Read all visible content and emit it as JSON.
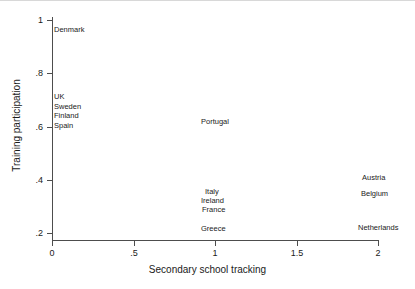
{
  "chart_data": {
    "type": "scatter",
    "title": "",
    "xlabel": "Secondary school tracking",
    "ylabel": "Training participation",
    "xlim": [
      -0.05,
      2.05
    ],
    "ylim": [
      0.17,
      1.03
    ],
    "grid": false,
    "legend": "none",
    "marker_style": "country-name-text-labels",
    "xticks": [
      "0",
      ".5",
      "1",
      "1.5",
      "2"
    ],
    "xtick_values": [
      0,
      0.5,
      1,
      1.5,
      2
    ],
    "yticks": [
      "1",
      ".8",
      ".6",
      ".4",
      ".2"
    ],
    "ytick_values": [
      1,
      0.8,
      0.6,
      0.4,
      0.2
    ],
    "points": [
      {
        "label": "Denmark",
        "x": 0,
        "y": 0.955
      },
      {
        "label": "UK",
        "x": 0,
        "y": 0.705
      },
      {
        "label": "Sweden",
        "x": 0,
        "y": 0.667
      },
      {
        "label": "Finland",
        "x": 0,
        "y": 0.633
      },
      {
        "label": "Spain",
        "x": 0,
        "y": 0.595
      },
      {
        "label": "Portugal",
        "x": 1,
        "y": 0.625
      },
      {
        "label": "Italy",
        "x": 1,
        "y": 0.36
      },
      {
        "label": "Ireland",
        "x": 1,
        "y": 0.325
      },
      {
        "label": "France",
        "x": 1,
        "y": 0.292
      },
      {
        "label": "Greece",
        "x": 1,
        "y": 0.22
      },
      {
        "label": "Austria",
        "x": 2,
        "y": 0.41
      },
      {
        "label": "Belgium",
        "x": 2,
        "y": 0.355
      },
      {
        "label": "Netherlands",
        "x": 2,
        "y": 0.228
      }
    ]
  },
  "axes": {
    "x_title": "Secondary school tracking",
    "y_title": "Training participation",
    "x_ticks": [
      {
        "label": "0",
        "left": 52
      },
      {
        "label": ".5",
        "left": 134
      },
      {
        "label": "1",
        "left": 215
      },
      {
        "label": "1.5",
        "left": 297
      },
      {
        "label": "2",
        "left": 378
      }
    ],
    "y_ticks": [
      {
        "label": "1",
        "top": 20
      },
      {
        "label": ".8",
        "top": 73
      },
      {
        "label": ".6",
        "top": 127
      },
      {
        "label": ".4",
        "top": 180
      },
      {
        "label": ".2",
        "top": 233
      }
    ]
  },
  "labels": [
    {
      "text": "Denmark",
      "left": 54,
      "top": 26
    },
    {
      "text": "UK",
      "left": 54,
      "top": 93
    },
    {
      "text": "Sweden",
      "left": 54,
      "top": 103
    },
    {
      "text": "Finland",
      "left": 54,
      "top": 112
    },
    {
      "text": "Spain",
      "left": 54,
      "top": 122
    },
    {
      "text": "Portugal",
      "left": 201,
      "top": 118
    },
    {
      "text": "Italy",
      "left": 205,
      "top": 188
    },
    {
      "text": "Ireland",
      "left": 201,
      "top": 197
    },
    {
      "text": "France",
      "left": 202,
      "top": 206
    },
    {
      "text": "Greece",
      "left": 201,
      "top": 225
    },
    {
      "text": "Austria",
      "left": 362,
      "top": 174
    },
    {
      "text": "Belgium",
      "left": 361,
      "top": 190
    },
    {
      "text": "Netherlands",
      "left": 358,
      "top": 224
    }
  ],
  "colors": {
    "background": "#ffffff",
    "axis": "#4d4d4d",
    "text": "#1a1a1a"
  }
}
